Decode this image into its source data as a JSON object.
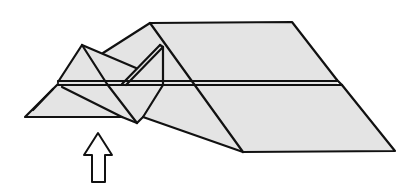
{
  "diagram": {
    "type": "origami-folding-step",
    "colors": {
      "paper": "#e4e4e4",
      "line": "#111111",
      "background": "#ffffff",
      "arrow_fill": "#ffffff"
    },
    "arrow": {
      "direction": "up",
      "style": "hollow-outline"
    }
  }
}
